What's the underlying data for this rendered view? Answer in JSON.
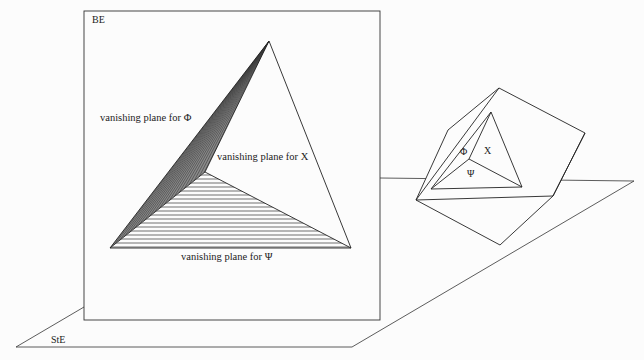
{
  "diagram": {
    "type": "perspective-projection",
    "labels": {
      "picture_plane": "BE",
      "ground_plane": "StE",
      "phi_plane": "vanishing plane for Φ",
      "chi_plane": "vanishing plane for X",
      "psi_plane": "vanishing plane for Ψ",
      "cube_phi": "Φ",
      "cube_chi": "X",
      "cube_psi": "Ψ"
    },
    "colors": {
      "line": "#222222",
      "background": "#fcfcfc",
      "hatch_dense": "#555555",
      "hatch_light": "#333333"
    }
  }
}
